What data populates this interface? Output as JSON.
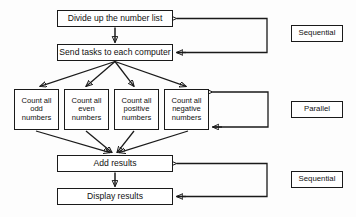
{
  "diagram": {
    "background_color": "#fdfdfd",
    "line_color": "#1a1a1a",
    "box_fill": "#ffffff"
  },
  "nodes": {
    "divide": {
      "label": "Divide up the number list",
      "x": 57,
      "y": 10,
      "w": 116,
      "h": 17
    },
    "send": {
      "label": "Send tasks to each computer",
      "x": 57,
      "y": 44,
      "w": 116,
      "h": 17
    },
    "count_odd": {
      "label": "Count all\nodd\nnumbers",
      "x": 14,
      "y": 89,
      "w": 45,
      "h": 41
    },
    "count_even": {
      "label": "Count all\neven\nnumbers",
      "x": 64,
      "y": 89,
      "w": 45,
      "h": 41
    },
    "count_positive": {
      "label": "Count all\npositive\nnumbers",
      "x": 114,
      "y": 89,
      "w": 45,
      "h": 41
    },
    "count_negative": {
      "label": "Count all\nnegative\nnumbers",
      "x": 164,
      "y": 89,
      "w": 45,
      "h": 41
    },
    "add": {
      "label": "Add results",
      "x": 57,
      "y": 155,
      "w": 116,
      "h": 17
    },
    "display": {
      "label": "Display results",
      "x": 57,
      "y": 188,
      "w": 116,
      "h": 17
    }
  },
  "tags": {
    "sequential_top": {
      "label": "Sequential",
      "x": 291,
      "y": 25,
      "w": 52,
      "h": 17
    },
    "parallel": {
      "label": "Parallel",
      "x": 291,
      "y": 101,
      "w": 52,
      "h": 17
    },
    "sequential_bottom": {
      "label": "Sequential",
      "x": 291,
      "y": 171,
      "w": 52,
      "h": 17
    }
  },
  "connections": {
    "divide_to_send": {
      "from": "divide",
      "to": "send",
      "type": "arrow-down"
    },
    "send_fanout": {
      "from": "send",
      "to": [
        "count_odd",
        "count_even",
        "count_positive",
        "count_negative"
      ],
      "type": "fan-out-arrows"
    },
    "counts_fanin": {
      "from": [
        "count_odd",
        "count_even",
        "count_positive",
        "count_negative"
      ],
      "to": "add",
      "type": "fan-in-arrows"
    },
    "add_to_display": {
      "from": "add",
      "to": "display",
      "type": "arrow-down"
    },
    "bracket_sequential_top": {
      "label_group": "Sequential",
      "targets": [
        "divide",
        "send"
      ],
      "type": "bracket-left-arrows"
    },
    "bracket_parallel": {
      "label_group": "Parallel",
      "targets": [
        "count_negative"
      ],
      "type": "bracket-left-arrows"
    },
    "bracket_sequential_bottom": {
      "label_group": "Sequential",
      "targets": [
        "add",
        "display"
      ],
      "type": "bracket-left-arrows"
    }
  }
}
